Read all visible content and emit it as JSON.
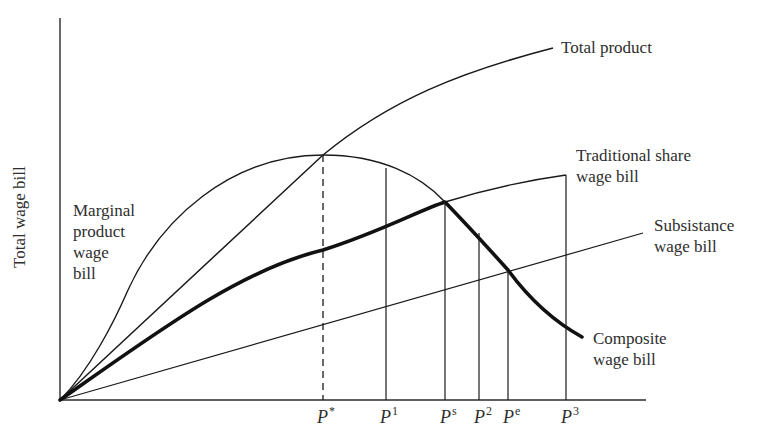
{
  "diagram": {
    "type": "economics wage bill diagram",
    "y_axis_label": "Total wage bill",
    "x_axis_label": ""
  },
  "curves": {
    "total_product": {
      "label": "Total product"
    },
    "traditional_share": {
      "label_line1": "Traditional share",
      "label_line2": "wage bill"
    },
    "subsistence": {
      "label_line1": "Subsistance",
      "label_line2": "wage bill"
    },
    "composite": {
      "label_line1": "Composite",
      "label_line2": "wage bill"
    },
    "marginal_product": {
      "label_line1": "Marginal",
      "label_line2": "product",
      "label_line3": "wage",
      "label_line4": "bill"
    }
  },
  "ticks": [
    {
      "base": "P",
      "sup": "*"
    },
    {
      "base": "P",
      "sup": "1"
    },
    {
      "base": "P",
      "sup": "s"
    },
    {
      "base": "P",
      "sup": "2"
    },
    {
      "base": "P",
      "sup": "e"
    },
    {
      "base": "P",
      "sup": "3"
    }
  ],
  "colors": {
    "line": "#1a1a1a",
    "text": "#2e2e2e",
    "background": "#ffffff"
  }
}
